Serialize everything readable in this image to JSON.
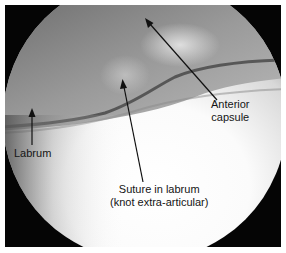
{
  "figure": {
    "type": "arthroscopic-image",
    "background_color": "#ffffff",
    "frame_color": "#050505",
    "annotations": [
      {
        "id": "labrum",
        "lines": [
          "Labrum"
        ]
      },
      {
        "id": "suture",
        "lines": [
          "Suture in labrum",
          "(knot extra-articular)"
        ]
      },
      {
        "id": "anterior-capsule",
        "lines": [
          "Anterior",
          "capsule"
        ]
      }
    ]
  }
}
